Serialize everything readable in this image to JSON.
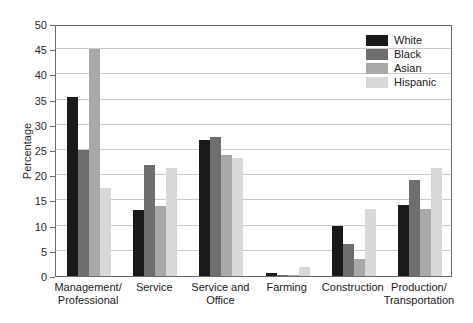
{
  "chart_data": {
    "type": "bar",
    "title": "",
    "xlabel": "",
    "ylabel": "Percentage",
    "ylim": [
      0,
      50
    ],
    "yticks": [
      0,
      5,
      10,
      15,
      20,
      25,
      30,
      35,
      40,
      45,
      50
    ],
    "ytick_labels": [
      "0",
      "5",
      "10",
      "15",
      "20",
      "25",
      "30",
      "35",
      "40",
      "45",
      "50"
    ],
    "grid": true,
    "legend_position": "top-right",
    "categories": [
      "Management/\nProfessional",
      "Service",
      "Service and\nOffice",
      "Farming",
      "Construction",
      "Production/\nTransportation"
    ],
    "series": [
      {
        "name": "White",
        "color": "#1a1a1a",
        "values": [
          35.5,
          13.0,
          27.0,
          0.6,
          10.0,
          14.0
        ]
      },
      {
        "name": "Black",
        "color": "#6e6e6e",
        "values": [
          25.0,
          22.0,
          27.5,
          0.3,
          6.3,
          19.0
        ]
      },
      {
        "name": "Asian",
        "color": "#a8a8a8",
        "values": [
          45.0,
          13.8,
          24.0,
          0.3,
          3.3,
          13.3
        ]
      },
      {
        "name": "Hispanic",
        "color": "#d8d8d8",
        "values": [
          17.5,
          21.5,
          23.5,
          1.8,
          13.3,
          21.5
        ]
      }
    ]
  },
  "axis": {
    "y_title": "Percentage"
  },
  "legend": {
    "entries": [
      {
        "label": "White",
        "color": "#1a1a1a"
      },
      {
        "label": "Black",
        "color": "#6e6e6e"
      },
      {
        "label": "Asian",
        "color": "#a8a8a8"
      },
      {
        "label": "Hispanic",
        "color": "#d8d8d8"
      }
    ]
  },
  "colors": {
    "frame": "#6b6b6b",
    "gridline": "#c9c9c9",
    "background": "#ffffff",
    "text": "#1a1a1a"
  }
}
